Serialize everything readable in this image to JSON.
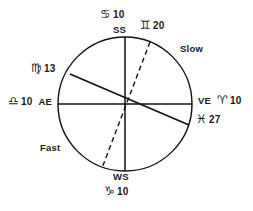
{
  "figure": {
    "type": "astronomical-equation-of-time-circle",
    "geometry": {
      "center_x": 125,
      "center_y": 104,
      "radius": 67,
      "stroke_color": "#111111"
    }
  },
  "labels": {
    "summer_solstice_sign": "♋",
    "summer_solstice_degree": "10",
    "summer_solstice_code": "SS",
    "gemini_sign": "♊",
    "gemini_degree": "20",
    "slow": "Slow",
    "virgo_sign": "♍",
    "virgo_degree": "13",
    "libra_sign": "♎",
    "libra_degree": "10",
    "autumnal_equinox_code": "AE",
    "vernal_equinox_code": "VE",
    "aries_sign": "♈",
    "aries_degree": "10",
    "pisces_sign": "♓",
    "pisces_degree": "27",
    "fast": "Fast",
    "winter_solstice_code": "WS",
    "capricorn_sign": "♑",
    "capricorn_degree": "10"
  },
  "lines": {
    "vertical_axis": {
      "name": "SS-WS axis",
      "x1": 125,
      "y1": 37,
      "x2": 125,
      "y2": 171,
      "style": "solid"
    },
    "horizontal_axis": {
      "name": "AE-VE axis",
      "x1": 58,
      "y1": 104,
      "x2": 192,
      "y2": 104,
      "style": "solid"
    },
    "apsides_line": {
      "name": "Virgo13-Pisces27 line",
      "x1": 70,
      "y1": 74,
      "x2": 189,
      "y2": 125,
      "style": "solid"
    },
    "dashed_line": {
      "name": "Gemini20 dashed line",
      "x1": 150,
      "y1": 42,
      "x2": 102,
      "y2": 168,
      "style": "dashed"
    }
  }
}
